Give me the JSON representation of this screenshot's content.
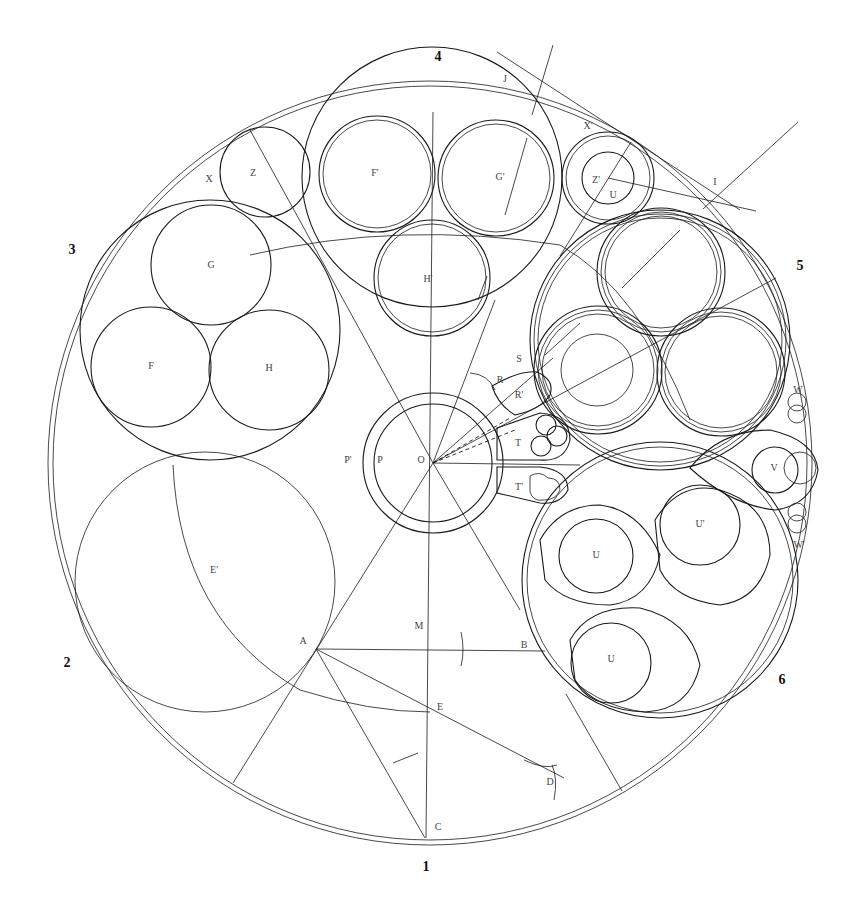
{
  "diagram": {
    "title": "",
    "stroke_color": "#1a1a1a",
    "label_color": "#444444",
    "background": "#ffffff"
  },
  "sector_numbers": [
    {
      "text": "1",
      "x": 426,
      "y": 871
    },
    {
      "text": "2",
      "x": 67,
      "y": 667
    },
    {
      "text": "3",
      "x": 72,
      "y": 254
    },
    {
      "text": "4",
      "x": 438,
      "y": 61
    },
    {
      "text": "5",
      "x": 800,
      "y": 270
    },
    {
      "text": "6",
      "x": 782,
      "y": 684
    }
  ],
  "labels": [
    {
      "text": "X",
      "x": 209,
      "y": 182
    },
    {
      "text": "Z",
      "x": 253,
      "y": 176
    },
    {
      "text": "F'",
      "x": 375,
      "y": 176
    },
    {
      "text": "G'",
      "x": 500,
      "y": 180
    },
    {
      "text": "H'",
      "x": 428,
      "y": 282
    },
    {
      "text": "J",
      "x": 505,
      "y": 82
    },
    {
      "text": "X'",
      "x": 588,
      "y": 129
    },
    {
      "text": "Z'",
      "x": 596,
      "y": 183
    },
    {
      "text": "U",
      "x": 613,
      "y": 198
    },
    {
      "text": "I",
      "x": 715,
      "y": 185
    },
    {
      "text": "G",
      "x": 211,
      "y": 268
    },
    {
      "text": "F",
      "x": 151,
      "y": 369
    },
    {
      "text": "H",
      "x": 269,
      "y": 371
    },
    {
      "text": "S",
      "x": 519,
      "y": 362
    },
    {
      "text": "R",
      "x": 500,
      "y": 383
    },
    {
      "text": "R'",
      "x": 519,
      "y": 398
    },
    {
      "text": "T",
      "x": 518,
      "y": 446
    },
    {
      "text": "T'",
      "x": 519,
      "y": 490
    },
    {
      "text": "P'",
      "x": 348,
      "y": 463
    },
    {
      "text": "P",
      "x": 380,
      "y": 463
    },
    {
      "text": "O",
      "x": 421,
      "y": 463
    },
    {
      "text": "W",
      "x": 798,
      "y": 393
    },
    {
      "text": "V",
      "x": 774,
      "y": 471
    },
    {
      "text": "U'",
      "x": 700,
      "y": 527
    },
    {
      "text": "U",
      "x": 596,
      "y": 558
    },
    {
      "text": "W'",
      "x": 799,
      "y": 548
    },
    {
      "text": "E'",
      "x": 214,
      "y": 573
    },
    {
      "text": "M",
      "x": 419,
      "y": 629
    },
    {
      "text": "B",
      "x": 524,
      "y": 648
    },
    {
      "text": "A",
      "x": 303,
      "y": 644
    },
    {
      "text": "U",
      "x": 611,
      "y": 662
    },
    {
      "text": "E",
      "x": 440,
      "y": 710
    },
    {
      "text": "D",
      "x": 550,
      "y": 785
    },
    {
      "text": "C",
      "x": 438,
      "y": 830
    }
  ],
  "geometry": {
    "center": {
      "x": 430,
      "y": 463
    },
    "outer_circles": [
      {
        "r": 382
      },
      {
        "r": 377
      }
    ]
  }
}
